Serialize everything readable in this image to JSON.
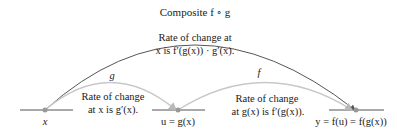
{
  "diagram": {
    "title": "Composite f ∘ g",
    "composite_rate": {
      "line1": "Rate of change at",
      "line2": "x is f′(g(x)) · g′(x)."
    },
    "g_arc": {
      "label": "g",
      "rate_line1": "Rate of change",
      "rate_line2": "at x is g′(x)."
    },
    "f_arc": {
      "label": "f",
      "rate_line1": "Rate of change",
      "rate_line2": "at g(x) is f′(g(x))."
    },
    "points": {
      "x": "x",
      "u": "u = g(x)",
      "y": "y = f(u) = f(g(x))"
    },
    "colors": {
      "composite_arc": "#555555",
      "g_arc": "#c8c8c8",
      "f_arc": "#c8c8c8",
      "axis_line": "#555555",
      "point": "#999999"
    }
  }
}
